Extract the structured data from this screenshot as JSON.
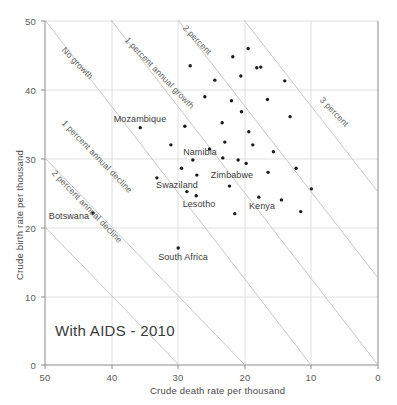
{
  "chart_data": {
    "type": "scatter",
    "title": "With AIDS - 2010",
    "xlabel": "Crude death rate per thousand",
    "ylabel": "Crude birth rate per thousand",
    "xlim": [
      50,
      0
    ],
    "xlim_note": "x axis is reversed: 50 at left, 0 at right",
    "ylim": [
      0,
      50
    ],
    "xticks": [
      50,
      40,
      30,
      20,
      10,
      0
    ],
    "yticks": [
      0,
      10,
      20,
      30,
      40,
      50
    ],
    "grid": true,
    "legend": "none",
    "reference_lines": [
      {
        "label": "No growth",
        "slope_note": "birth = death",
        "intercept": 0
      },
      {
        "label": "1 percent annual growth",
        "intercept": 10
      },
      {
        "label": "2 percent",
        "intercept": 20
      },
      {
        "label": "3 percent",
        "intercept": 30
      },
      {
        "label": "1 percent annual decline",
        "intercept": -10
      },
      {
        "label": "2 percent annual decline",
        "intercept": -20
      }
    ],
    "points": [
      {
        "label": "Mozambique",
        "x": 35.7,
        "y": 34.5
      },
      {
        "label": "Namibia",
        "x": 27.8,
        "y": 29.8
      },
      {
        "label": "Zimbabwe",
        "x": 27.2,
        "y": 27.6
      },
      {
        "label": "Swaziland",
        "x": 28.7,
        "y": 25.2
      },
      {
        "label": "Lesotho",
        "x": 27.3,
        "y": 24.6
      },
      {
        "label": "Kenya",
        "x": 17.9,
        "y": 24.4
      },
      {
        "label": "Botswana",
        "x": 42.8,
        "y": 22.1
      },
      {
        "label": "South Africa",
        "x": 30.0,
        "y": 17.0
      },
      {
        "label": "",
        "x": 28.2,
        "y": 43.5
      },
      {
        "label": "",
        "x": 24.5,
        "y": 41.4
      },
      {
        "label": "",
        "x": 21.8,
        "y": 44.8
      },
      {
        "label": "",
        "x": 19.5,
        "y": 46.0
      },
      {
        "label": "",
        "x": 18.2,
        "y": 43.2
      },
      {
        "label": "",
        "x": 17.6,
        "y": 43.3
      },
      {
        "label": "",
        "x": 20.6,
        "y": 42.0
      },
      {
        "label": "",
        "x": 14.0,
        "y": 41.3
      },
      {
        "label": "",
        "x": 26.0,
        "y": 39.0
      },
      {
        "label": "",
        "x": 22.0,
        "y": 38.4
      },
      {
        "label": "",
        "x": 20.5,
        "y": 36.8
      },
      {
        "label": "",
        "x": 16.6,
        "y": 38.6
      },
      {
        "label": "",
        "x": 23.4,
        "y": 35.2
      },
      {
        "label": "",
        "x": 13.2,
        "y": 36.1
      },
      {
        "label": "",
        "x": 19.4,
        "y": 33.9
      },
      {
        "label": "",
        "x": 29.0,
        "y": 34.7
      },
      {
        "label": "",
        "x": 23.0,
        "y": 32.4
      },
      {
        "label": "",
        "x": 18.8,
        "y": 32.0
      },
      {
        "label": "",
        "x": 25.3,
        "y": 31.4
      },
      {
        "label": "",
        "x": 31.1,
        "y": 32.0
      },
      {
        "label": "",
        "x": 15.7,
        "y": 31.0
      },
      {
        "label": "",
        "x": 23.3,
        "y": 30.1
      },
      {
        "label": "",
        "x": 21.0,
        "y": 29.8
      },
      {
        "label": "",
        "x": 19.8,
        "y": 29.3
      },
      {
        "label": "",
        "x": 29.5,
        "y": 28.6
      },
      {
        "label": "",
        "x": 16.5,
        "y": 28.0
      },
      {
        "label": "",
        "x": 33.2,
        "y": 27.2
      },
      {
        "label": "",
        "x": 22.3,
        "y": 26.0
      },
      {
        "label": "",
        "x": 12.3,
        "y": 28.6
      },
      {
        "label": "",
        "x": 10.0,
        "y": 25.6
      },
      {
        "label": "",
        "x": 14.5,
        "y": 24.0
      },
      {
        "label": "",
        "x": 21.5,
        "y": 22.0
      },
      {
        "label": "",
        "x": 11.6,
        "y": 22.3
      }
    ]
  }
}
